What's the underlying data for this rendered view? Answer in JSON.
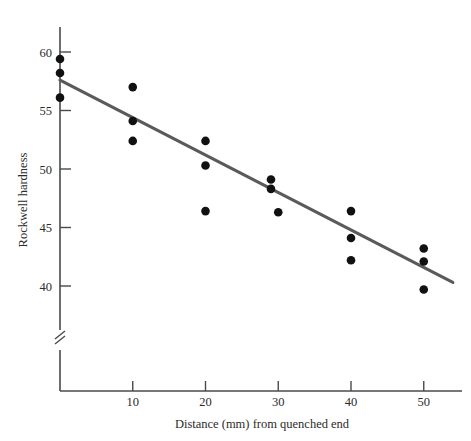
{
  "chart_data": {
    "type": "scatter",
    "title": "",
    "xlabel": "Distance (mm) from quenched end",
    "ylabel": "Rockwell hardness",
    "xlim": [
      0,
      54.5
    ],
    "ylim": [
      38.5,
      61.2
    ],
    "grid": false,
    "legend": null,
    "axis_break": {
      "axis": "y",
      "symbol": "double-slash",
      "note": "broken y-axis below lowest tick"
    },
    "xticks": [
      10,
      20,
      30,
      40,
      50
    ],
    "xtick_labels": [
      "10",
      "20",
      "30",
      "40",
      "50"
    ],
    "yticks": [
      40,
      45,
      50,
      55,
      60
    ],
    "ytick_labels": [
      "40",
      "45",
      "50",
      "55",
      "60"
    ],
    "series": [
      {
        "name": "Rockwell hardness measurements",
        "marker": "filled-circle",
        "color": "#111111",
        "points": [
          {
            "x": 0,
            "y": 59.4
          },
          {
            "x": 0,
            "y": 58.2
          },
          {
            "x": 0,
            "y": 56.1
          },
          {
            "x": 10,
            "y": 57.0
          },
          {
            "x": 10,
            "y": 54.1
          },
          {
            "x": 10,
            "y": 52.4
          },
          {
            "x": 20,
            "y": 52.4
          },
          {
            "x": 20,
            "y": 50.3
          },
          {
            "x": 20,
            "y": 46.4
          },
          {
            "x": 29,
            "y": 49.1
          },
          {
            "x": 29,
            "y": 48.3
          },
          {
            "x": 30,
            "y": 46.3
          },
          {
            "x": 40,
            "y": 46.4
          },
          {
            "x": 40,
            "y": 44.1
          },
          {
            "x": 40,
            "y": 42.2
          },
          {
            "x": 50,
            "y": 43.2
          },
          {
            "x": 50,
            "y": 42.1
          },
          {
            "x": 50,
            "y": 39.7
          }
        ]
      }
    ],
    "fit_line": {
      "name": "least-squares regression line",
      "color": "#5a5a5a",
      "x_start": 0,
      "y_start": 57.6,
      "x_end": 54.0,
      "y_end": 40.3
    }
  }
}
